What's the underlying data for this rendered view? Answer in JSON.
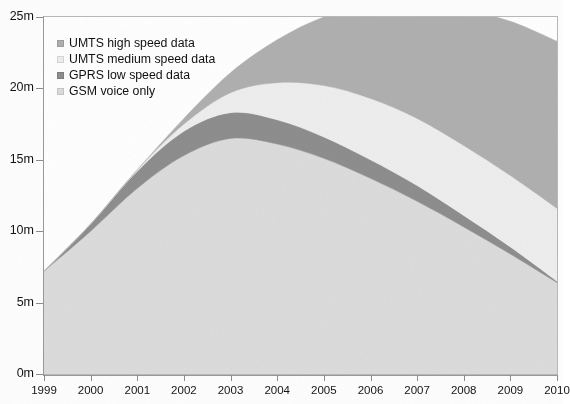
{
  "chart_data": {
    "type": "area",
    "stacked": true,
    "title": "",
    "subtitle": "",
    "xlabel": "",
    "ylabel": "",
    "x": [
      1999,
      2000,
      2001,
      2002,
      2003,
      2004,
      2005,
      2006,
      2007,
      2008,
      2009,
      2010
    ],
    "categories": [
      "1999",
      "2000",
      "2001",
      "2002",
      "2003",
      "2004",
      "2005",
      "2006",
      "2007",
      "2008",
      "2009",
      "2010"
    ],
    "xlim": [
      1999,
      2010
    ],
    "ylim": [
      0,
      25
    ],
    "y_ticks": [
      0,
      5,
      10,
      15,
      20,
      25
    ],
    "y_tick_labels": [
      "0m",
      "5m",
      "10m",
      "15m",
      "20m",
      "25m"
    ],
    "x_tick_labels": [
      "1999",
      "2000",
      "2001",
      "2002",
      "2003",
      "2004",
      "2005",
      "2006",
      "2007",
      "2008",
      "2009",
      "2010"
    ],
    "unit": "m",
    "grid": false,
    "legend_position": "top-left",
    "series": [
      {
        "name": "GSM voice only",
        "color": "#dcdcdc",
        "values": [
          7.2,
          10.0,
          13.0,
          15.3,
          16.5,
          16.1,
          15.1,
          13.7,
          12.1,
          10.3,
          8.4,
          6.4
        ]
      },
      {
        "name": "GPRS low speed data",
        "color": "#8e8e8e",
        "values": [
          0.0,
          0.5,
          1.2,
          1.7,
          1.8,
          1.7,
          1.5,
          1.3,
          1.1,
          0.8,
          0.5,
          0.1
        ]
      },
      {
        "name": "UMTS medium speed data",
        "color": "#eeeeee",
        "values": [
          0.0,
          0.0,
          0.1,
          0.5,
          1.4,
          2.6,
          3.6,
          4.3,
          4.7,
          4.9,
          5.0,
          5.1
        ]
      },
      {
        "name": "UMTS high speed data",
        "color": "#b0b0b0",
        "values": [
          0.0,
          0.0,
          0.0,
          0.4,
          1.4,
          3.0,
          4.8,
          6.5,
          8.0,
          9.5,
          10.8,
          11.7
        ]
      }
    ],
    "totals": [
      7.2,
      10.5,
      14.3,
      17.9,
      21.1,
      23.4,
      25.0,
      25.8,
      25.9,
      25.5,
      24.7,
      23.3
    ],
    "stack_order_bottom_to_top": [
      "GSM voice only",
      "GPRS low speed data",
      "UMTS medium speed data",
      "UMTS high speed data"
    ]
  },
  "legend": {
    "items": [
      {
        "label": "UMTS high speed data",
        "color": "#b0b0b0"
      },
      {
        "label": "UMTS medium speed data",
        "color": "#eeeeee"
      },
      {
        "label": "GPRS low speed data",
        "color": "#8e8e8e"
      },
      {
        "label": "GSM voice only",
        "color": "#dcdcdc"
      }
    ]
  },
  "axes": {
    "y_labels": [
      "25m",
      "20m",
      "15m",
      "10m",
      "5m",
      "0m"
    ],
    "x_labels": [
      "1999",
      "2000",
      "2001",
      "2002",
      "2003",
      "2004",
      "2005",
      "2006",
      "2007",
      "2008",
      "2009",
      "2010"
    ]
  }
}
